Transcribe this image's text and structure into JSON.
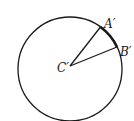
{
  "diagram": {
    "type": "circle-sector",
    "labels": {
      "point_a": "A′",
      "point_b": "B′",
      "center": "C′"
    },
    "colors": {
      "stroke": "#1a1a1a",
      "background": "#ffffff"
    }
  }
}
